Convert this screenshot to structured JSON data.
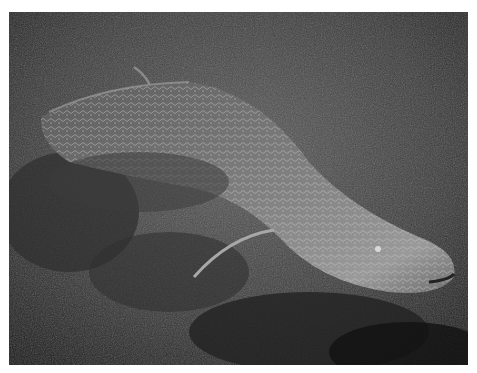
{
  "image": {
    "subject": "Lungfish resting on algae-covered lake bottom",
    "description": "Black-and-white underwater photograph of a large mottled eel-like lungfish lying among filamentous algae, head toward lower right, thin pectoral fin trailing",
    "colors": {
      "border": "#ffffff",
      "background_dark": "#1e1e1e",
      "algae_mid": "#4a4a4a",
      "body_mid": "#7a7a7a",
      "body_highlight": "#c8c8c8"
    }
  }
}
